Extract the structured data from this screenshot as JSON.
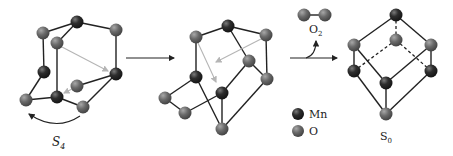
{
  "colors": {
    "mn": "#2b2b2b",
    "o": "#6b6b6b",
    "bond": "#222222",
    "hint_arrow": "#b5b5b5"
  },
  "legend": {
    "items": [
      {
        "element": "Mn",
        "label": "Mn"
      },
      {
        "element": "O",
        "label": "O"
      }
    ]
  },
  "structures": [
    {
      "id": "S4",
      "label_main": "S",
      "label_sub": "4"
    },
    {
      "id": "intermediate",
      "label_main": "",
      "label_sub": ""
    },
    {
      "id": "S0",
      "label_main": "S",
      "label_sub": "0"
    }
  ],
  "released_molecule": {
    "label_main": "O",
    "label_sub": "2"
  }
}
